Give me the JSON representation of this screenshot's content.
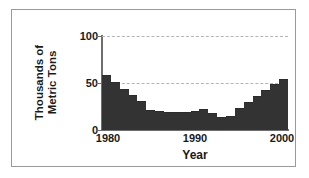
{
  "chart_data": {
    "type": "bar",
    "title": "",
    "xlabel": "Year",
    "ylabel": "Thousands of Metric Tons",
    "ylabel_line1": "Thousands of",
    "ylabel_line2": "Metric Tons",
    "xlim": [
      1980,
      2000
    ],
    "ylim": [
      0,
      100
    ],
    "yticks": [
      0,
      50,
      100
    ],
    "ytick_labels": [
      "0",
      "50",
      "100"
    ],
    "xticks": [
      1980,
      1990,
      2000
    ],
    "xtick_labels": [
      "1980",
      "1990",
      "2000"
    ],
    "grid": "horizontal-dashed",
    "legend": "none",
    "bar_color": "#333333",
    "grid_color": "#b5b5b5",
    "axis_color": "#6e6e6e",
    "frame_color": "#9a9a9a",
    "categories": [
      1980,
      1981,
      1982,
      1983,
      1984,
      1985,
      1986,
      1987,
      1988,
      1989,
      1990,
      1991,
      1992,
      1993,
      1994,
      1995,
      1996,
      1997,
      1998,
      1999,
      2000
    ],
    "values": [
      57,
      50,
      43,
      36,
      30,
      20,
      19,
      18,
      18,
      18,
      19,
      21,
      17,
      13,
      14,
      22,
      29,
      35,
      42,
      48,
      53
    ],
    "series": [
      {
        "name": "Production",
        "values": [
          57,
          50,
          43,
          36,
          30,
          20,
          19,
          18,
          18,
          18,
          19,
          21,
          17,
          13,
          14,
          22,
          29,
          35,
          42,
          48,
          53
        ]
      }
    ]
  }
}
